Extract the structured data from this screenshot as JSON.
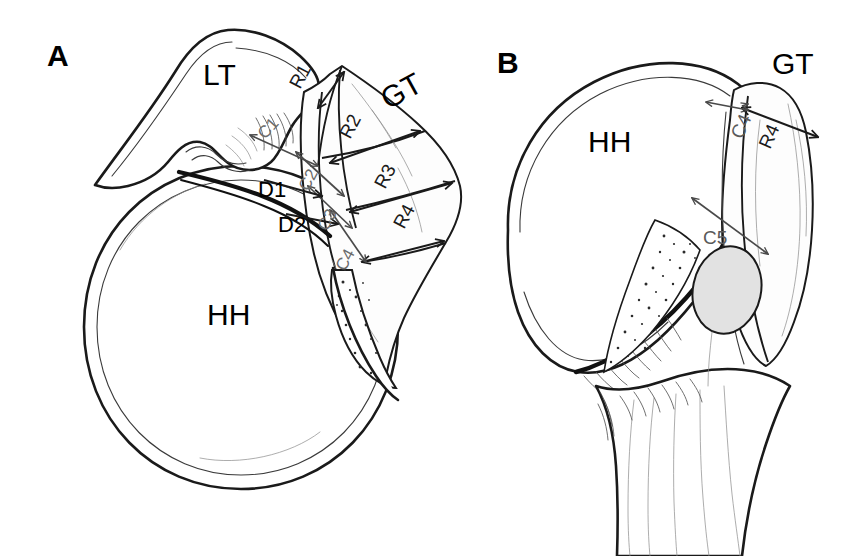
{
  "figure": {
    "background_color": "#ffffff",
    "width": 863,
    "height": 556,
    "line_color": "#1a1a1a",
    "gray_label_color": "#6b6b6b",
    "cartilage_fill": "#e2e2e2"
  },
  "panels": [
    {
      "id": "A",
      "letter": "A",
      "view": "superior",
      "labels": {
        "lesser_tuberosity": "LT",
        "humeral_head": "HH",
        "greater_tuberosity": "GT"
      },
      "rows": [
        {
          "id": "R1",
          "label": "R1"
        },
        {
          "id": "R2",
          "label": "R2"
        },
        {
          "id": "R3",
          "label": "R3"
        },
        {
          "id": "R4",
          "label": "R4"
        }
      ],
      "columns": [
        {
          "id": "C1",
          "label": "C1"
        },
        {
          "id": "C2",
          "label": "C2"
        },
        {
          "id": "C3",
          "label": "C3"
        },
        {
          "id": "C4",
          "label": "C4"
        }
      ],
      "distances": [
        {
          "id": "D1",
          "label": "D1"
        },
        {
          "id": "D2",
          "label": "D2"
        }
      ]
    },
    {
      "id": "B",
      "letter": "B",
      "view": "lateral",
      "labels": {
        "humeral_head": "HH",
        "greater_tuberosity": "GT"
      },
      "rows": [
        {
          "id": "R4",
          "label": "R4"
        }
      ],
      "columns": [
        {
          "id": "C4",
          "label": "C4"
        },
        {
          "id": "C5",
          "label": "C5"
        }
      ]
    }
  ]
}
